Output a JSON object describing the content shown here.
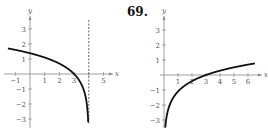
{
  "problem_number": "69.",
  "chart_data": [
    {
      "type": "line",
      "title": "",
      "xlabel": "x",
      "ylabel": "y",
      "x_ticks": [
        -1,
        1,
        2,
        3,
        5
      ],
      "y_ticks": [
        -3,
        -2,
        -1,
        1,
        2,
        3
      ],
      "xlim": [
        -1.5,
        5.5
      ],
      "ylim": [
        -3.5,
        3.8
      ],
      "grid": false,
      "asymptote": {
        "type": "vertical",
        "x": 4,
        "style": "dashed"
      },
      "series": [
        {
          "name": "curve",
          "x": [
            -1.5,
            -1,
            0,
            1,
            2,
            3,
            3.5,
            3.9,
            3.97
          ],
          "y": [
            1.7,
            1.61,
            1.39,
            1.1,
            0.69,
            0,
            -0.69,
            -2.3,
            -3.5
          ]
        }
      ]
    },
    {
      "type": "line",
      "title": "",
      "xlabel": "x",
      "ylabel": "y",
      "x_ticks": [
        1,
        2,
        3,
        4,
        5,
        6
      ],
      "y_ticks": [
        -3,
        -2,
        -1,
        1,
        2,
        3
      ],
      "xlim": [
        0,
        6.8
      ],
      "ylim": [
        -3.5,
        3.8
      ],
      "grid": false,
      "series": [
        {
          "name": "curve",
          "x": [
            0.09,
            0.25,
            0.5,
            1,
            2,
            3,
            4,
            5,
            6,
            6.5
          ],
          "y": [
            -3.5,
            -2.48,
            -1.79,
            -1.1,
            -0.41,
            0,
            0.29,
            0.51,
            0.69,
            0.77
          ]
        }
      ]
    }
  ]
}
